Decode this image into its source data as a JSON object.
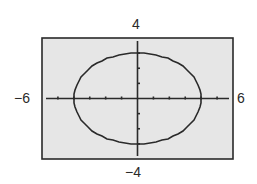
{
  "chart_data": {
    "type": "line",
    "title": "",
    "equation": "x^2/16 + y^2/9 = 1",
    "xlabel": "",
    "ylabel": "",
    "xlim": [
      -6,
      6
    ],
    "ylim": [
      -4,
      4
    ],
    "xtick_step": 1,
    "ytick_step": 1,
    "grid": false,
    "series": [
      {
        "name": "ellipse",
        "center": [
          0,
          0
        ],
        "semi_major_x": 4,
        "semi_minor_y": 3,
        "x_intercepts": [
          -4,
          4
        ],
        "y_intercepts": [
          -3,
          3
        ]
      }
    ],
    "window_labels": {
      "xmin": "−6",
      "xmax": "6",
      "ymin": "−4",
      "ymax": "4"
    }
  },
  "colors": {
    "frame": "#2a2a2a",
    "background": "#e6e6e6",
    "curve": "#2a2a2a",
    "axes": "#2a2a2a"
  }
}
